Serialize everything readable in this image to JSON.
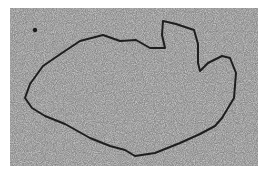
{
  "image": {
    "description": "Grayscale electron micrograph showing a single closed circular strand (loop) on a speckled granular background",
    "colors": {
      "background_mid": "#8a8a8a",
      "speckle_light": "#e6e6e6",
      "speckle_dark": "#3a3a3a",
      "strand": "#1e1e1e",
      "border": "#ffffff"
    }
  }
}
